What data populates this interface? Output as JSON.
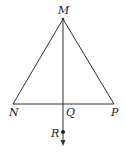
{
  "diagram": {
    "type": "geometry-triangle",
    "points": {
      "M": {
        "label": "M",
        "x": 63,
        "y": 19
      },
      "N": {
        "label": "N",
        "x": 13,
        "y": 104
      },
      "P": {
        "label": "P",
        "x": 114,
        "y": 104
      },
      "Q": {
        "label": "Q",
        "x": 63,
        "y": 104
      },
      "R": {
        "label": "R",
        "x": 63,
        "y": 132
      }
    },
    "segments": [
      "MN",
      "MP",
      "NP",
      "MQ"
    ],
    "ray": {
      "from": "M",
      "through": "R",
      "direction": "down"
    },
    "colors": {
      "line": "#333333",
      "text": "#222222"
    }
  }
}
